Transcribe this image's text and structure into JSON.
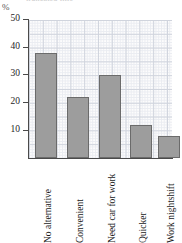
{
  "chart_data": {
    "type": "bar",
    "title": "",
    "xlabel": "",
    "ylabel": "%",
    "ylim": [
      0,
      50
    ],
    "yticks": [
      10,
      20,
      30,
      40,
      50
    ],
    "grid": true,
    "legend": "none",
    "categories": [
      "No alternative",
      "Convenient",
      "Need car for work",
      "Quicker",
      "Work nightshift"
    ],
    "values": [
      38,
      22,
      30,
      12,
      8
    ],
    "series": [
      {
        "name": "Percentage of respondents",
        "values": [
          38,
          22,
          30,
          12,
          8
        ]
      }
    ],
    "bar_color": "#9d9d9d",
    "bar_border_color": "#6b6b6b",
    "grid_color": "#d0d4dd",
    "axis_color": "#4a4a4a"
  },
  "axis": {
    "unit_label": "%",
    "tick_labels": [
      "50",
      "40",
      "30",
      "20",
      "10"
    ]
  },
  "title_sliver": {
    "text": "truncated title"
  }
}
